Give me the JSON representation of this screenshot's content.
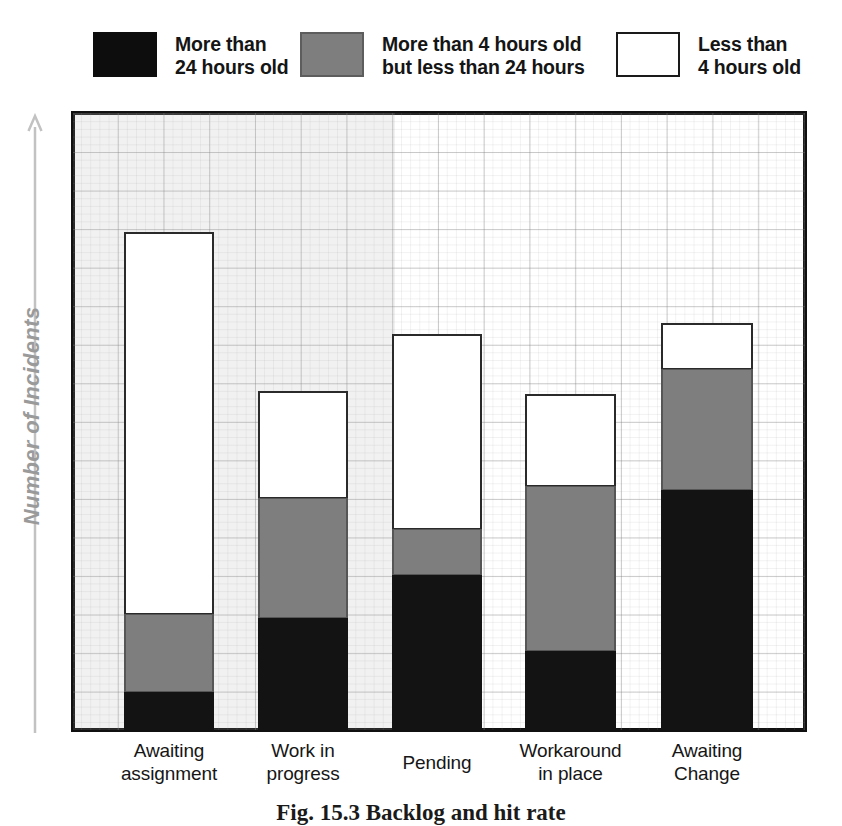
{
  "chart_data": {
    "type": "bar",
    "subtype": "stacked-vertical",
    "title": "",
    "xlabel": "",
    "ylabel": "Number of Incidents",
    "ylim": [
      0,
      617
    ],
    "y_axis_ticks_shown": false,
    "grid": true,
    "grid_major_spacing_px": 38.56,
    "legend_position": "top",
    "categories": [
      "Awaiting assignment",
      "Work in progress",
      "Pending",
      "Workaround in place",
      "Awaiting Change"
    ],
    "series": [
      {
        "name": "More than 24 hours old",
        "color": "#131313",
        "values": [
          38,
          112,
          155,
          79,
          240
        ]
      },
      {
        "name": "More than 4 hours old but less than 24 hours",
        "color": "#7e7e7e",
        "values": [
          78,
          120,
          46,
          165,
          121
        ]
      },
      {
        "name": "Less than 4 hours old",
        "color": "#ffffff",
        "values": [
          382,
          107,
          195,
          92,
          46
        ]
      }
    ],
    "totals": [
      498,
      339,
      396,
      336,
      407
    ]
  },
  "legend": {
    "items": [
      {
        "swatch": "black-swatch",
        "line1": "More than",
        "line2": "24 hours old"
      },
      {
        "swatch": "gray-swatch",
        "line1": "More than 4 hours old",
        "line2": "but less than 24 hours"
      },
      {
        "swatch": "white-swatch",
        "line1": "Less than",
        "line2": "4 hours old"
      }
    ]
  },
  "yaxis": {
    "title": "Number of Incidents",
    "arrow": "up-arrow-icon"
  },
  "xaxis": {
    "labels": [
      {
        "line1": "Awaiting",
        "line2": "assignment"
      },
      {
        "line1": "Work in",
        "line2": "progress"
      },
      {
        "line1": "Pending",
        "line2": ""
      },
      {
        "line1": "Workaround",
        "line2": "in place"
      },
      {
        "line1": "Awaiting",
        "line2": "Change"
      }
    ]
  },
  "caption": {
    "text": "Fig. 15.3  Backlog and hit rate"
  },
  "colors": {
    "black_segment": "#131313",
    "gray_segment": "#7e7e7e",
    "white_segment": "#ffffff",
    "plot_border": "#101010",
    "grid_line": "#787878",
    "axis_label": "#9a9a9a",
    "background": "#ffffff"
  }
}
